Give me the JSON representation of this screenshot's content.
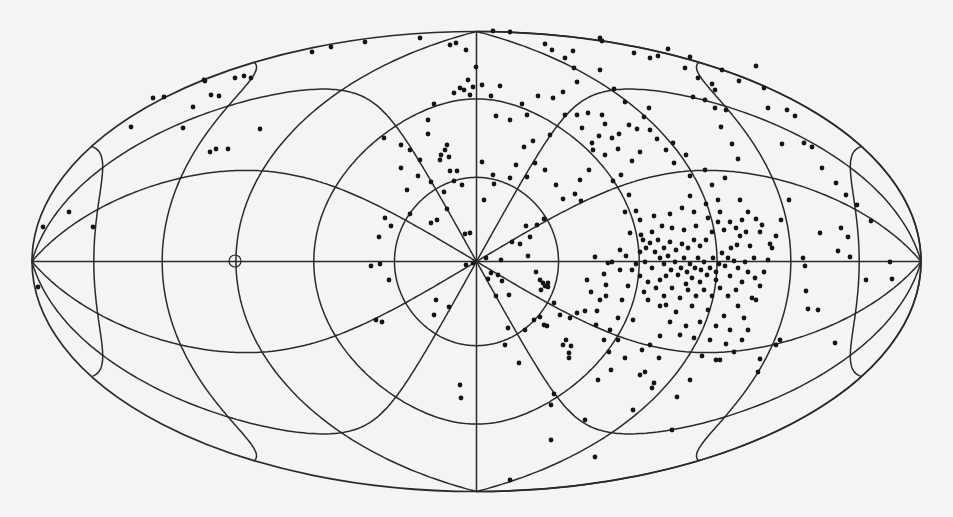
{
  "figure": {
    "background": "#f4f4f2",
    "line_color": "#2a2a2a",
    "dot_color": "#151515"
  },
  "chart_data": {
    "type": "scatter",
    "title": "",
    "xlabel": "",
    "ylabel": "",
    "projection": "hammer-aitoff",
    "legend": [],
    "grid": {
      "on": true,
      "kind": "polar about map centre",
      "concentric_circles_deg": [
        30,
        60,
        90,
        120,
        150
      ],
      "radial_lines_every_deg": 30,
      "equator_line": true
    },
    "frame_px": {
      "cx": 476.5,
      "cy": 261.5,
      "half_width": 444.5,
      "half_height": 230
    },
    "special_marker": {
      "shape": "open-circle",
      "x": 235,
      "y": 261,
      "r": 6
    },
    "dense_cluster_px": {
      "x": 690,
      "y": 265,
      "radius": 60
    },
    "secondary_clumps_px": [
      {
        "x": 444,
        "y": 155
      },
      {
        "x": 466,
        "y": 90
      },
      {
        "x": 541,
        "y": 282
      },
      {
        "x": 568,
        "y": 340
      },
      {
        "x": 650,
        "y": 242
      }
    ],
    "points_px": [
      [
        43,
        227
      ],
      [
        38,
        287
      ],
      [
        69,
        212
      ],
      [
        93,
        227
      ],
      [
        131,
        127
      ],
      [
        153,
        98
      ],
      [
        164,
        97
      ],
      [
        183,
        128
      ],
      [
        193,
        107
      ],
      [
        204,
        80
      ],
      [
        211,
        95
      ],
      [
        219,
        96
      ],
      [
        228,
        149
      ],
      [
        210,
        152
      ],
      [
        216,
        149
      ],
      [
        235,
        78
      ],
      [
        244,
        76
      ],
      [
        260,
        129
      ],
      [
        251,
        78
      ],
      [
        205,
        81
      ],
      [
        312,
        52
      ],
      [
        331,
        47
      ],
      [
        365,
        42
      ],
      [
        420,
        38
      ],
      [
        450,
        45
      ],
      [
        466,
        50
      ],
      [
        456,
        43
      ],
      [
        493,
        31
      ],
      [
        510,
        32
      ],
      [
        545,
        44
      ],
      [
        552,
        50
      ],
      [
        565,
        58
      ],
      [
        573,
        51
      ],
      [
        600,
        38
      ],
      [
        602,
        41
      ],
      [
        634,
        53
      ],
      [
        650,
        58
      ],
      [
        658,
        56
      ],
      [
        668,
        49
      ],
      [
        685,
        68
      ],
      [
        690,
        57
      ],
      [
        698,
        78
      ],
      [
        712,
        84
      ],
      [
        715,
        90
      ],
      [
        722,
        70
      ],
      [
        739,
        81
      ],
      [
        756,
        66
      ],
      [
        764,
        88
      ],
      [
        768,
        108
      ],
      [
        787,
        110
      ],
      [
        795,
        116
      ],
      [
        782,
        144
      ],
      [
        804,
        143
      ],
      [
        812,
        147
      ],
      [
        822,
        168
      ],
      [
        836,
        183
      ],
      [
        846,
        195
      ],
      [
        857,
        205
      ],
      [
        841,
        228
      ],
      [
        848,
        237
      ],
      [
        820,
        233
      ],
      [
        803,
        258
      ],
      [
        805,
        266
      ],
      [
        838,
        251
      ],
      [
        850,
        257
      ],
      [
        871,
        221
      ],
      [
        866,
        280
      ],
      [
        890,
        262
      ],
      [
        892,
        279
      ],
      [
        808,
        309
      ],
      [
        806,
        291
      ],
      [
        818,
        310
      ],
      [
        835,
        343
      ],
      [
        780,
        340
      ],
      [
        776,
        345
      ],
      [
        748,
        330
      ],
      [
        760,
        359
      ],
      [
        758,
        372
      ],
      [
        677,
        397
      ],
      [
        672,
        430
      ],
      [
        716,
        360
      ],
      [
        690,
        380
      ],
      [
        650,
        345
      ],
      [
        654,
        383
      ],
      [
        645,
        372
      ],
      [
        640,
        375
      ],
      [
        652,
        388
      ],
      [
        642,
        350
      ],
      [
        659,
        358
      ],
      [
        633,
        410
      ],
      [
        666,
        305
      ],
      [
        680,
        335
      ],
      [
        660,
        336
      ],
      [
        384,
        138
      ],
      [
        385,
        218
      ],
      [
        401,
        168
      ],
      [
        407,
        190
      ],
      [
        401,
        145
      ],
      [
        410,
        214
      ],
      [
        391,
        226
      ],
      [
        379,
        237
      ],
      [
        371,
        266
      ],
      [
        380,
        264
      ],
      [
        389,
        280
      ],
      [
        376,
        320
      ],
      [
        382,
        322
      ],
      [
        431,
        223
      ],
      [
        437,
        220
      ],
      [
        431,
        182
      ],
      [
        444,
        192
      ],
      [
        447,
        209
      ],
      [
        450,
        171
      ],
      [
        440,
        160
      ],
      [
        445,
        150
      ],
      [
        447,
        145
      ],
      [
        441,
        155
      ],
      [
        449,
        157
      ],
      [
        454,
        181
      ],
      [
        462,
        185
      ],
      [
        457,
        171
      ],
      [
        465,
        234
      ],
      [
        470,
        233
      ],
      [
        466,
        265
      ],
      [
        473,
        263
      ],
      [
        486,
        258
      ],
      [
        491,
        273
      ],
      [
        488,
        279
      ],
      [
        498,
        275
      ],
      [
        501,
        260
      ],
      [
        502,
        281
      ],
      [
        496,
        296
      ],
      [
        509,
        295
      ],
      [
        512,
        242
      ],
      [
        520,
        244
      ],
      [
        530,
        237
      ],
      [
        526,
        226
      ],
      [
        537,
        225
      ],
      [
        544,
        219
      ],
      [
        528,
        256
      ],
      [
        536,
        272
      ],
      [
        540,
        280
      ],
      [
        543,
        283
      ],
      [
        548,
        283
      ],
      [
        554,
        303
      ],
      [
        566,
        340
      ],
      [
        569,
        353
      ],
      [
        570,
        318
      ],
      [
        577,
        313
      ],
      [
        585,
        311
      ],
      [
        597,
        311
      ],
      [
        606,
        285
      ],
      [
        595,
        257
      ],
      [
        608,
        263
      ],
      [
        620,
        250
      ],
      [
        630,
        233
      ],
      [
        625,
        212
      ],
      [
        636,
        211
      ],
      [
        629,
        195
      ],
      [
        621,
        175
      ],
      [
        613,
        181
      ],
      [
        605,
        155
      ],
      [
        592,
        143
      ],
      [
        582,
        128
      ],
      [
        577,
        115
      ],
      [
        565,
        115
      ],
      [
        563,
        92
      ],
      [
        553,
        98
      ],
      [
        538,
        96
      ],
      [
        522,
        104
      ],
      [
        527,
        115
      ],
      [
        510,
        120
      ],
      [
        496,
        116
      ],
      [
        500,
        86
      ],
      [
        491,
        96
      ],
      [
        482,
        85
      ],
      [
        476,
        67
      ],
      [
        464,
        90
      ],
      [
        470,
        95
      ],
      [
        473,
        87
      ],
      [
        468,
        80
      ],
      [
        460,
        88
      ],
      [
        454,
        93
      ],
      [
        434,
        104
      ],
      [
        428,
        120
      ],
      [
        428,
        134
      ],
      [
        420,
        160
      ],
      [
        410,
        150
      ],
      [
        418,
        176
      ],
      [
        482,
        162
      ],
      [
        493,
        175
      ],
      [
        484,
        200
      ],
      [
        494,
        184
      ],
      [
        510,
        178
      ],
      [
        516,
        165
      ],
      [
        527,
        177
      ],
      [
        545,
        170
      ],
      [
        535,
        163
      ],
      [
        550,
        135
      ],
      [
        524,
        147
      ],
      [
        533,
        141
      ],
      [
        556,
        185
      ],
      [
        563,
        199
      ],
      [
        575,
        194
      ],
      [
        581,
        201
      ],
      [
        580,
        180
      ],
      [
        589,
        170
      ],
      [
        593,
        150
      ],
      [
        599,
        136
      ],
      [
        612,
        138
      ],
      [
        619,
        134
      ],
      [
        637,
        129
      ],
      [
        629,
        125
      ],
      [
        644,
        117
      ],
      [
        649,
        108
      ],
      [
        625,
        102
      ],
      [
        614,
        89
      ],
      [
        600,
        70
      ],
      [
        574,
        68
      ],
      [
        577,
        82
      ],
      [
        588,
        113
      ],
      [
        602,
        115
      ],
      [
        605,
        124
      ],
      [
        618,
        149
      ],
      [
        632,
        161
      ],
      [
        640,
        152
      ],
      [
        650,
        130
      ],
      [
        657,
        139
      ],
      [
        666,
        150
      ],
      [
        673,
        143
      ],
      [
        686,
        155
      ],
      [
        674,
        163
      ],
      [
        690,
        176
      ],
      [
        705,
        170
      ],
      [
        712,
        185
      ],
      [
        725,
        178
      ],
      [
        738,
        159
      ],
      [
        732,
        144
      ],
      [
        721,
        127
      ],
      [
        726,
        110
      ],
      [
        715,
        108
      ],
      [
        705,
        100
      ],
      [
        693,
        97
      ],
      [
        740,
        200
      ],
      [
        748,
        212
      ],
      [
        756,
        219
      ],
      [
        760,
        232
      ],
      [
        770,
        244
      ],
      [
        781,
        220
      ],
      [
        789,
        200
      ],
      [
        641,
        235
      ],
      [
        643,
        240
      ],
      [
        646,
        248
      ],
      [
        650,
        243
      ],
      [
        655,
        252
      ],
      [
        645,
        262
      ],
      [
        652,
        268
      ],
      [
        660,
        258
      ],
      [
        664,
        264
      ],
      [
        668,
        256
      ],
      [
        671,
        270
      ],
      [
        675,
        262
      ],
      [
        678,
        275
      ],
      [
        681,
        268
      ],
      [
        684,
        258
      ],
      [
        687,
        272
      ],
      [
        690,
        264
      ],
      [
        692,
        278
      ],
      [
        695,
        268
      ],
      [
        698,
        258
      ],
      [
        701,
        270
      ],
      [
        704,
        262
      ],
      [
        707,
        275
      ],
      [
        710,
        268
      ],
      [
        713,
        258
      ],
      [
        716,
        272
      ],
      [
        719,
        264
      ],
      [
        722,
        253
      ],
      [
        725,
        266
      ],
      [
        728,
        258
      ],
      [
        731,
        248
      ],
      [
        734,
        261
      ],
      [
        737,
        245
      ],
      [
        740,
        236
      ],
      [
        736,
        228
      ],
      [
        730,
        222
      ],
      [
        724,
        230
      ],
      [
        718,
        222
      ],
      [
        712,
        232
      ],
      [
        706,
        240
      ],
      [
        700,
        246
      ],
      [
        694,
        240
      ],
      [
        688,
        248
      ],
      [
        682,
        244
      ],
      [
        676,
        250
      ],
      [
        670,
        242
      ],
      [
        664,
        248
      ],
      [
        658,
        240
      ],
      [
        652,
        232
      ],
      [
        662,
        226
      ],
      [
        672,
        228
      ],
      [
        684,
        230
      ],
      [
        696,
        226
      ],
      [
        708,
        218
      ],
      [
        720,
        212
      ],
      [
        742,
        220
      ],
      [
        746,
        232
      ],
      [
        750,
        246
      ],
      [
        754,
        258
      ],
      [
        748,
        272
      ],
      [
        742,
        282
      ],
      [
        736,
        290
      ],
      [
        728,
        296
      ],
      [
        720,
        288
      ],
      [
        712,
        296
      ],
      [
        704,
        290
      ],
      [
        696,
        296
      ],
      [
        688,
        290
      ],
      [
        680,
        298
      ],
      [
        672,
        288
      ],
      [
        664,
        296
      ],
      [
        656,
        288
      ],
      [
        648,
        282
      ],
      [
        640,
        276
      ],
      [
        644,
        292
      ],
      [
        660,
        306
      ],
      [
        676,
        312
      ],
      [
        692,
        306
      ],
      [
        708,
        310
      ],
      [
        724,
        316
      ],
      [
        738,
        306
      ],
      [
        752,
        298
      ],
      [
        760,
        286
      ],
      [
        764,
        272
      ],
      [
        768,
        260
      ],
      [
        772,
        248
      ],
      [
        776,
        236
      ],
      [
        762,
        225
      ],
      [
        756,
        300
      ],
      [
        744,
        318
      ],
      [
        730,
        330
      ],
      [
        716,
        326
      ],
      [
        700,
        322
      ],
      [
        686,
        326
      ],
      [
        670,
        322
      ],
      [
        694,
        338
      ],
      [
        710,
        340
      ],
      [
        726,
        344
      ],
      [
        742,
        340
      ],
      [
        702,
        356
      ],
      [
        720,
        360
      ],
      [
        734,
        352
      ],
      [
        745,
        262
      ],
      [
        755,
        278
      ],
      [
        640,
        252
      ],
      [
        636,
        264
      ],
      [
        648,
        300
      ],
      [
        660,
        280
      ],
      [
        700,
        282
      ],
      [
        716,
        280
      ],
      [
        686,
        284
      ],
      [
        666,
        276
      ],
      [
        730,
        276
      ],
      [
        738,
        268
      ],
      [
        670,
        214
      ],
      [
        682,
        208
      ],
      [
        694,
        212
      ],
      [
        706,
        204
      ],
      [
        718,
        200
      ],
      [
        690,
        196
      ],
      [
        654,
        216
      ],
      [
        640,
        220
      ],
      [
        632,
        270
      ],
      [
        628,
        286
      ],
      [
        622,
        300
      ],
      [
        618,
        318
      ],
      [
        610,
        330
      ],
      [
        606,
        296
      ],
      [
        604,
        274
      ],
      [
        612,
        262
      ],
      [
        620,
        270
      ],
      [
        626,
        256
      ],
      [
        434,
        315
      ],
      [
        449,
        307
      ],
      [
        508,
        328
      ],
      [
        525,
        330
      ],
      [
        505,
        345
      ],
      [
        551,
        405
      ],
      [
        554,
        394
      ],
      [
        519,
        363
      ],
      [
        436,
        300
      ],
      [
        460,
        385
      ],
      [
        461,
        398
      ],
      [
        551,
        440
      ],
      [
        510,
        480
      ],
      [
        540,
        317
      ],
      [
        544,
        325
      ],
      [
        547,
        326
      ],
      [
        541,
        290
      ],
      [
        545,
        286
      ],
      [
        548,
        287
      ],
      [
        534,
        320
      ],
      [
        560,
        315
      ],
      [
        563,
        345
      ],
      [
        571,
        346
      ],
      [
        569,
        358
      ],
      [
        587,
        280
      ],
      [
        591,
        292
      ],
      [
        600,
        300
      ],
      [
        596,
        325
      ],
      [
        604,
        340
      ],
      [
        609,
        352
      ],
      [
        625,
        358
      ],
      [
        633,
        320
      ],
      [
        618,
        340
      ],
      [
        611,
        370
      ],
      [
        598,
        380
      ],
      [
        585,
        420
      ],
      [
        595,
        457
      ]
    ]
  }
}
